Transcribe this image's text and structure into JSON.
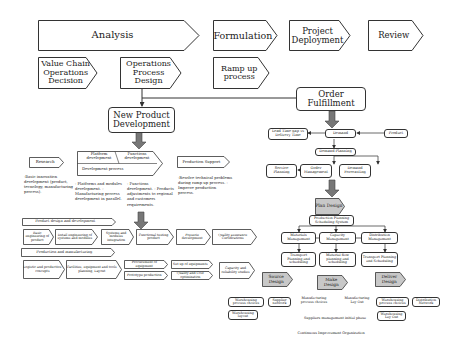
{
  "phases": [
    {
      "label": "Analysis"
    },
    {
      "label": "Formulation"
    },
    {
      "label": "Project Deployment"
    },
    {
      "label": "Review"
    }
  ],
  "decisions": [
    {
      "label": "Value Chain Operations Decision"
    },
    {
      "label": "Operations Process Design"
    },
    {
      "label": "Ramp up process"
    }
  ],
  "npd": {
    "title": "New Product Development",
    "research": {
      "label": "Research",
      "notes": "-Basic innovation development (product, tecnology, manufacturing process)."
    },
    "platform": {
      "label": "Platform development",
      "functions_label": "Functions development",
      "process_label": "Development process"
    },
    "platform_notes": "- Platforms and modules development. - Manufacturing process development in parallel.",
    "functions_notes": "- Functions development. - Products adjustments to regional and customers requirements.",
    "production_support": {
      "label": "Production Support",
      "notes": "-Resolve technical problems during ramp up process. - Improve production process."
    },
    "product_design": {
      "header": "Product design and development",
      "steps": [
        "Basic engineering of product",
        "Detail engineering of systems and modules",
        "Systems and modules integration",
        "Functional testing product",
        "Preserie development",
        "Quality assurance Certifications"
      ]
    },
    "production": {
      "header": "Production and manufacturing",
      "steps": [
        "Logistic and productive concepts",
        "Facilities, equipment and tools planning, Layout",
        "Procurement of equipment",
        "Prototype production",
        "Set up of equipments",
        "Quality and Cost optimization",
        "Capacity and reliability studies"
      ]
    }
  },
  "ofp": {
    "title": "Order Fulfillment",
    "lead_time": "Lead Time gap vs Delivery Time",
    "demand": "Demand",
    "product": "Product",
    "demand_planning": "Demand Planning",
    "service_planning": "Service Planning",
    "order_management": "Order Management",
    "demand_forecasting": "Demand Forecasting",
    "plan_design": "Plan Design",
    "pps": "Production Planning Scheduling System",
    "materials_mgmt": "Materials Management",
    "capacity_mgmt": "Capacity Management",
    "distribution_mgmt": "Distribution Management",
    "transport_planning_1": "Transport Planning and scheduling",
    "material_flow": "Material flow planning and scheduling",
    "transport_planning_2": "Transport Planning and Scheduling",
    "source_design": "Source Design",
    "make_design": "Make Design",
    "deliver_design": "Deliver Design",
    "warehousing_process_choices_1": "Warehousing process choices",
    "supplier_network": "Supplier network",
    "manufacturing_process_choices": "Manufacturing process choices",
    "manufacturing_layout": "Manufacturing Lay Out",
    "warehousing_process_choices_2": "Warehousing process choices",
    "distribution_network": "Distribution Network",
    "warehousing_layout_1": "Warehousing layout",
    "warehousing_layout_2": "Warehousing Lay Out",
    "suppliers_mgmt": "Suppliers management initial phase",
    "continuous_improvement": "Continuous Improvement Organization"
  }
}
